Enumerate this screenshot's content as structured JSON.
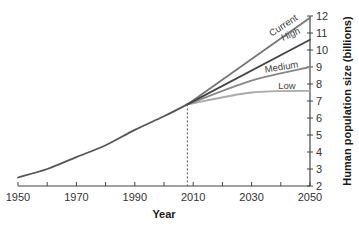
{
  "chart_data": {
    "type": "line",
    "title": "",
    "xlabel": "Year",
    "ylabel": "Human population size (billions)",
    "xlim": [
      1950,
      2050
    ],
    "ylim": [
      2,
      12
    ],
    "x_ticks": [
      1950,
      1960,
      1970,
      1980,
      1990,
      2000,
      2010,
      2020,
      2030,
      2040,
      2050
    ],
    "x_tick_labels": [
      "1950",
      "1970",
      "1990",
      "2010",
      "2030",
      "2050"
    ],
    "y_ticks": [
      2,
      3,
      4,
      5,
      6,
      7,
      8,
      9,
      10,
      11,
      12
    ],
    "y_tick_labels": [
      "2",
      "3",
      "4",
      "5",
      "6",
      "7",
      "8",
      "9",
      "10",
      "11",
      "12"
    ],
    "y_axis_position": "right",
    "grid": false,
    "reference_line": {
      "type": "vertical-dashed",
      "x": 2008
    },
    "series": [
      {
        "name": "Historical",
        "x": [
          1950,
          1960,
          1970,
          1980,
          1990,
          2000,
          2008
        ],
        "values": [
          2.5,
          3.0,
          3.7,
          4.4,
          5.3,
          6.1,
          6.8
        ],
        "color": "#555555"
      },
      {
        "name": "Current",
        "x": [
          2008,
          2050
        ],
        "values": [
          6.8,
          11.9
        ],
        "color": "#777777"
      },
      {
        "name": "High",
        "x": [
          2008,
          2050
        ],
        "values": [
          6.8,
          10.6
        ],
        "color": "#444444"
      },
      {
        "name": "Medium",
        "x": [
          2008,
          2030,
          2050
        ],
        "values": [
          6.8,
          8.2,
          9.0
        ],
        "color": "#888888"
      },
      {
        "name": "Low",
        "x": [
          2008,
          2030,
          2050
        ],
        "values": [
          6.8,
          7.5,
          7.6
        ],
        "color": "#aaaaaa"
      }
    ],
    "legend_position": "inline-labels"
  }
}
